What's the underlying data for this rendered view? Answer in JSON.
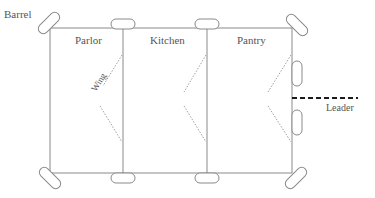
{
  "diagram": {
    "type": "floor-plan",
    "rooms": [
      {
        "id": "parlor",
        "label": "Parlor"
      },
      {
        "id": "kitchen",
        "label": "Kitchen"
      },
      {
        "id": "pantry",
        "label": "Pantry"
      }
    ],
    "annotations": {
      "barrel": "Barrel",
      "wing": "Wing",
      "leader": "Leader"
    },
    "colors": {
      "line": "#8a8a8a",
      "text": "#555555",
      "leader": "#1a1a1a",
      "dashed": "#a0a0a0"
    }
  }
}
